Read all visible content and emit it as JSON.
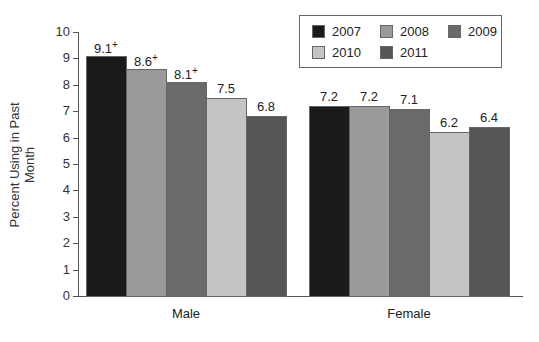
{
  "chart_data": {
    "type": "bar",
    "title": "",
    "xlabel": "",
    "ylabel": "Percent Using in Past Month",
    "ylim": [
      0,
      10
    ],
    "yticks": [
      0,
      1,
      2,
      3,
      4,
      5,
      6,
      7,
      8,
      9,
      10
    ],
    "categories": [
      "Male",
      "Female"
    ],
    "series": [
      {
        "name": "2007",
        "color": "#1a1a1a",
        "values": [
          9.1,
          7.2
        ],
        "labels": [
          "9.1+",
          "7.2"
        ]
      },
      {
        "name": "2008",
        "color": "#9a9a9a",
        "values": [
          8.6,
          7.2
        ],
        "labels": [
          "8.6+",
          "7.2"
        ]
      },
      {
        "name": "2009",
        "color": "#6a6a6a",
        "values": [
          8.1,
          7.1
        ],
        "labels": [
          "8.1+",
          "7.1"
        ]
      },
      {
        "name": "2010",
        "color": "#c4c4c4",
        "values": [
          7.5,
          6.2
        ],
        "labels": [
          "7.5",
          "6.2"
        ]
      },
      {
        "name": "2011",
        "color": "#555555",
        "values": [
          6.8,
          6.4
        ],
        "labels": [
          "6.8",
          "6.4"
        ]
      }
    ],
    "legend_position": "top-right",
    "grid": false,
    "annotation": "+ marks values significantly different from 2011"
  }
}
